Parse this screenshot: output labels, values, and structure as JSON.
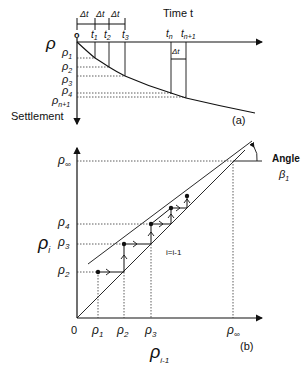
{
  "panel_a": {
    "caption": "(a)",
    "x_axis_label": "Time t",
    "y_axis_symbol": "ρ",
    "y_axis_label": "Settlement",
    "origin_label": "o",
    "time_ticks": [
      "t1",
      "t2",
      "t3",
      "tn",
      "tn+1"
    ],
    "time_tick_display": {
      "t1": {
        "base": "t",
        "sub": "1"
      },
      "t2": {
        "base": "t",
        "sub": "2"
      },
      "t3": {
        "base": "t",
        "sub": "3"
      },
      "tn": {
        "base": "t",
        "sub": "n"
      },
      "tn1": {
        "base": "t",
        "sub": "n+1"
      }
    },
    "interval_label": "Δt",
    "settlement_labels": [
      {
        "base": "ρ",
        "sub": "1"
      },
      {
        "base": "ρ",
        "sub": "2"
      },
      {
        "base": "ρ",
        "sub": "3"
      },
      {
        "base": "ρ",
        "sub": "4"
      },
      {
        "base": "ρ",
        "sub": "n+1"
      }
    ]
  },
  "panel_b": {
    "caption": "(b)",
    "x_axis_label": {
      "base": "ρ",
      "sub": "i-1"
    },
    "y_axis_label": {
      "base": "ρ",
      "sub": "i"
    },
    "origin_label": "0",
    "x_ticks": [
      {
        "base": "ρ",
        "sub": "1"
      },
      {
        "base": "ρ",
        "sub": "2"
      },
      {
        "base": "ρ",
        "sub": "3"
      },
      {
        "base": "ρ",
        "sub": "∞"
      }
    ],
    "y_ticks": [
      {
        "base": "ρ",
        "sub": "2"
      },
      {
        "base": "ρ",
        "sub": "3"
      },
      {
        "base": "ρ",
        "sub": "4"
      },
      {
        "base": "ρ",
        "sub": "∞"
      }
    ],
    "line_label": "i=i-1",
    "angle_label": "Angle",
    "angle_symbol": {
      "base": "β",
      "sub": "1"
    }
  }
}
